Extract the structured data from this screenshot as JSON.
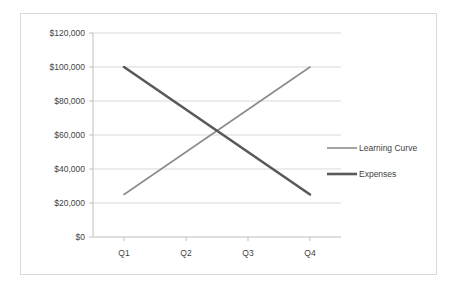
{
  "chart_data": {
    "type": "line",
    "title": "",
    "subtitle": "",
    "xlabel": "",
    "ylabel": "",
    "categories": [
      "Q1",
      "Q2",
      "Q3",
      "Q4"
    ],
    "series": [
      {
        "name": "Learning Curve",
        "values": [
          25000,
          50000,
          75000,
          100000
        ],
        "color": "#8c8c8c",
        "width": 1.6
      },
      {
        "name": "Expenses",
        "values": [
          100000,
          75000,
          50000,
          25000
        ],
        "color": "#595959",
        "width": 2.6
      }
    ],
    "ylim": [
      0,
      120000
    ],
    "ytick_values": [
      0,
      20000,
      40000,
      60000,
      80000,
      100000,
      120000
    ],
    "ytick_labels": [
      "$0",
      "$20,000",
      "$40,000",
      "$60,000",
      "$80,000",
      "$100,000",
      "$120,000"
    ],
    "xtick_labels": [
      "Q1",
      "Q2",
      "Q3",
      "Q4"
    ],
    "grid": true,
    "grid_axis": "y",
    "grid_color": "#d9d9d9",
    "legend_position": "right",
    "legend_entries": [
      "Learning Curve",
      "Expenses"
    ],
    "annotations": [],
    "plot_background": "#ffffff",
    "border_color": "#d9d9d9"
  },
  "axes": {
    "y_labels": {
      "t0": "$0",
      "t1": "$20,000",
      "t2": "$40,000",
      "t3": "$60,000",
      "t4": "$80,000",
      "t5": "$100,000",
      "t6": "$120,000"
    },
    "x_labels": {
      "q1": "Q1",
      "q2": "Q2",
      "q3": "Q3",
      "q4": "Q4"
    }
  },
  "legend": {
    "item1": "Learning Curve",
    "item2": "Expenses"
  }
}
